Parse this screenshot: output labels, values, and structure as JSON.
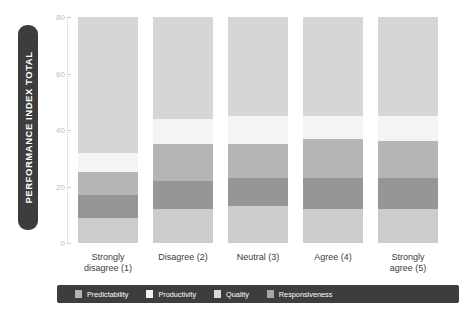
{
  "axis": {
    "y_title": "PERFORMANCE INDEX TOTAL",
    "y_ticks": [
      "0",
      "20",
      "40",
      "60",
      "80"
    ],
    "y_tick_values": [
      0,
      20,
      40,
      60,
      80
    ]
  },
  "legend": {
    "items": [
      {
        "label": "Predictability",
        "color": "#b3b3b3"
      },
      {
        "label": "Productivity",
        "color": "#f2f2f2"
      },
      {
        "label": "Quality",
        "color": "#d9d9d9"
      },
      {
        "label": "Responsiveness",
        "color": "#a6a6a6"
      }
    ]
  },
  "chart_data": {
    "type": "bar",
    "stacked": true,
    "title": "",
    "xlabel": "",
    "ylabel": "PERFORMANCE INDEX TOTAL",
    "ylim": [
      0,
      80
    ],
    "grid": false,
    "legend_position": "bottom",
    "categories": [
      "Strongly\ndisagree (1)",
      "Disagree (2)",
      "Neutral (3)",
      "Agree (4)",
      "Strongly\nagree (5)"
    ],
    "category_labels": [
      {
        "line1": "Strongly",
        "line2": "disagree (1)"
      },
      {
        "line1": "Disagree (2)",
        "line2": ""
      },
      {
        "line1": "Neutral (3)",
        "line2": ""
      },
      {
        "line1": "Agree (4)",
        "line2": ""
      },
      {
        "line1": "Strongly",
        "line2": "agree (5)"
      }
    ],
    "series": [
      {
        "name": "Predictability",
        "color": "#cccccc",
        "values": [
          9,
          12,
          13,
          12,
          12
        ]
      },
      {
        "name": "Responsiveness",
        "color": "#969696",
        "values": [
          8,
          10,
          10,
          11,
          11
        ]
      },
      {
        "name": "Quality",
        "color": "#b5b5b5",
        "values": [
          8,
          13,
          12,
          14,
          13
        ]
      },
      {
        "name": "Productivity",
        "color": "#f4f4f4",
        "values": [
          7,
          9,
          10,
          8,
          9
        ]
      },
      {
        "name": "Predictability_top",
        "color": "#d6d6d6",
        "values": [
          48,
          36,
          35,
          35,
          35
        ]
      }
    ],
    "totals": [
      80,
      80,
      80,
      80,
      80
    ]
  }
}
